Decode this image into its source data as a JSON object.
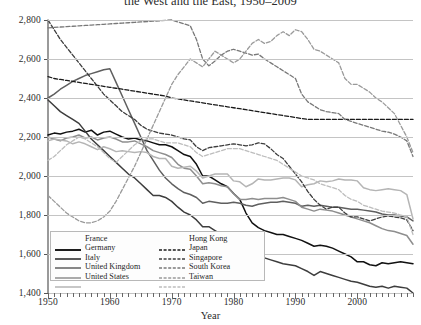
{
  "title": "the West and the East, 1950–2009",
  "axes": {
    "ylabel": "Hours",
    "xlabel": "Year",
    "yticks": [
      "1,400",
      "1,600",
      "1,800",
      "2,000",
      "2,200",
      "2,400",
      "2,600",
      "2,800"
    ],
    "xticks": [
      "1950",
      "1960",
      "1970",
      "1980",
      "1990",
      "2000"
    ]
  },
  "legend": {
    "left": [
      {
        "label": "France",
        "color": "#111111",
        "dash": "none",
        "width": 1.9
      },
      {
        "label": "Germany",
        "color": "#3d3d3d",
        "dash": "none",
        "width": 1.7
      },
      {
        "label": "Italy",
        "color": "#5f5f5f",
        "dash": "none",
        "width": 1.5
      },
      {
        "label": "United Kingdom",
        "color": "#8e8e8e",
        "dash": "none",
        "width": 1.5
      },
      {
        "label": "United States",
        "color": "#b5b5b5",
        "dash": "none",
        "width": 1.5
      }
    ],
    "right": [
      {
        "label": "Hong Kong",
        "color": "#1a1a1a",
        "dash": "4,2",
        "width": 1.5
      },
      {
        "label": "Japan",
        "color": "#3d3d3d",
        "dash": "4,2",
        "width": 1.5
      },
      {
        "label": "Singapore",
        "color": "#787878",
        "dash": "4,2",
        "width": 1.4
      },
      {
        "label": "South Korea",
        "color": "#9a9a9a",
        "dash": "4,2",
        "width": 1.4
      },
      {
        "label": "Taiwan",
        "color": "#bdbdbd",
        "dash": "4,2",
        "width": 1.4
      }
    ]
  },
  "chart_data": {
    "type": "line",
    "title": "the West and the East, 1950–2009",
    "xlabel": "Year",
    "ylabel": "Hours",
    "xlim": [
      1950,
      2009
    ],
    "ylim": [
      1400,
      2800
    ],
    "grid": true,
    "legend_position": "inside-bottom-left",
    "x": [
      1950,
      1951,
      1952,
      1953,
      1954,
      1955,
      1956,
      1957,
      1958,
      1959,
      1960,
      1961,
      1962,
      1963,
      1964,
      1965,
      1966,
      1967,
      1968,
      1969,
      1970,
      1971,
      1972,
      1973,
      1974,
      1975,
      1976,
      1977,
      1978,
      1979,
      1980,
      1981,
      1982,
      1983,
      1984,
      1985,
      1986,
      1987,
      1988,
      1989,
      1990,
      1991,
      1992,
      1993,
      1994,
      1995,
      1996,
      1997,
      1998,
      1999,
      2000,
      2001,
      2002,
      2003,
      2004,
      2005,
      2006,
      2007,
      2008,
      2009
    ],
    "series": [
      {
        "name": "France",
        "color": "#111111",
        "dash": "none",
        "values": [
          2210,
          2220,
          2215,
          2225,
          2230,
          2240,
          2225,
          2235,
          2210,
          2225,
          2230,
          2215,
          2200,
          2190,
          2195,
          2185,
          2180,
          2170,
          2160,
          2160,
          2150,
          2130,
          2110,
          2100,
          2060,
          2000,
          2000,
          1980,
          1960,
          1945,
          1910,
          1880,
          1810,
          1760,
          1735,
          1720,
          1710,
          1700,
          1700,
          1690,
          1680,
          1670,
          1655,
          1640,
          1645,
          1640,
          1630,
          1615,
          1600,
          1585,
          1560,
          1560,
          1545,
          1540,
          1555,
          1550,
          1555,
          1560,
          1555,
          1550
        ]
      },
      {
        "name": "Germany",
        "color": "#3d3d3d",
        "dash": "none",
        "values": [
          2390,
          2360,
          2330,
          2310,
          2290,
          2270,
          2230,
          2190,
          2160,
          2130,
          2100,
          2070,
          2040,
          2010,
          1990,
          1960,
          1930,
          1900,
          1900,
          1890,
          1870,
          1840,
          1815,
          1800,
          1775,
          1740,
          1740,
          1720,
          1700,
          1690,
          1670,
          1650,
          1620,
          1600,
          1590,
          1580,
          1570,
          1560,
          1550,
          1545,
          1540,
          1525,
          1510,
          1490,
          1510,
          1500,
          1490,
          1480,
          1470,
          1460,
          1455,
          1445,
          1435,
          1430,
          1435,
          1425,
          1435,
          1430,
          1425,
          1400
        ]
      },
      {
        "name": "Italy",
        "color": "#5f5f5f",
        "dash": "none",
        "values": [
          2400,
          2420,
          2445,
          2465,
          2485,
          2500,
          2515,
          2525,
          2535,
          2545,
          2550,
          2480,
          2410,
          2340,
          2270,
          2200,
          2130,
          2080,
          2030,
          1990,
          1960,
          1935,
          1915,
          1905,
          1890,
          1860,
          1870,
          1865,
          1860,
          1860,
          1865,
          1860,
          1850,
          1845,
          1855,
          1860,
          1865,
          1865,
          1870,
          1865,
          1860,
          1845,
          1850,
          1845,
          1850,
          1845,
          1840,
          1840,
          1835,
          1830,
          1830,
          1825,
          1820,
          1815,
          1805,
          1800,
          1800,
          1795,
          1790,
          1770
        ]
      },
      {
        "name": "United Kingdom",
        "color": "#8e8e8e",
        "dash": "none",
        "values": [
          2200,
          2190,
          2180,
          2195,
          2200,
          2210,
          2195,
          2200,
          2185,
          2195,
          2200,
          2190,
          2175,
          2175,
          2180,
          2165,
          2150,
          2130,
          2120,
          2110,
          2095,
          2060,
          2040,
          2035,
          2000,
          1960,
          1965,
          1960,
          1950,
          1945,
          1910,
          1880,
          1880,
          1885,
          1880,
          1885,
          1885,
          1885,
          1890,
          1880,
          1870,
          1840,
          1830,
          1820,
          1830,
          1825,
          1820,
          1810,
          1800,
          1790,
          1780,
          1770,
          1760,
          1745,
          1730,
          1720,
          1715,
          1705,
          1695,
          1650
        ]
      },
      {
        "name": "United States",
        "color": "#b5b5b5",
        "dash": "none",
        "values": [
          2180,
          2190,
          2185,
          2180,
          2165,
          2175,
          2165,
          2150,
          2135,
          2150,
          2140,
          2125,
          2130,
          2125,
          2120,
          2125,
          2120,
          2100,
          2090,
          2090,
          2050,
          2040,
          2045,
          2050,
          2025,
          1990,
          2000,
          2010,
          2010,
          2010,
          1975,
          1970,
          1945,
          1960,
          1985,
          1980,
          1980,
          1985,
          1990,
          1990,
          1980,
          1945,
          1955,
          1960,
          1975,
          1970,
          1975,
          1985,
          1980,
          1980,
          1975,
          1940,
          1930,
          1925,
          1930,
          1935,
          1930,
          1925,
          1905,
          1780
        ]
      },
      {
        "name": "Hong Kong",
        "color": "#1a1a1a",
        "dash": "4,2",
        "values": [
          2510,
          2500,
          2495,
          2490,
          2485,
          2480,
          2475,
          2470,
          2465,
          2460,
          2455,
          2450,
          2445,
          2440,
          2435,
          2430,
          2425,
          2420,
          2415,
          2410,
          2400,
          2395,
          2390,
          2385,
          2380,
          2375,
          2370,
          2365,
          2360,
          2355,
          2350,
          2345,
          2340,
          2335,
          2330,
          2325,
          2320,
          2315,
          2310,
          2305,
          2300,
          2295,
          2290,
          2290,
          2290,
          2290,
          2290,
          2290,
          2290,
          2290,
          2290,
          2290,
          2290,
          2290,
          2290,
          2290,
          2290,
          2290,
          2290,
          2290
        ]
      },
      {
        "name": "Japan",
        "color": "#3d3d3d",
        "dash": "4,2",
        "values": [
          2800,
          2750,
          2700,
          2660,
          2620,
          2580,
          2540,
          2500,
          2460,
          2420,
          2390,
          2360,
          2330,
          2310,
          2290,
          2260,
          2240,
          2230,
          2220,
          2215,
          2210,
          2200,
          2190,
          2185,
          2150,
          2130,
          2145,
          2150,
          2155,
          2160,
          2165,
          2160,
          2155,
          2160,
          2170,
          2165,
          2140,
          2110,
          2090,
          2050,
          2010,
          1970,
          1920,
          1880,
          1850,
          1830,
          1840,
          1840,
          1810,
          1790,
          1790,
          1780,
          1770,
          1780,
          1790,
          1795,
          1790,
          1785,
          1775,
          1720
        ]
      },
      {
        "name": "Singapore",
        "color": "#787878",
        "dash": "4,2",
        "values": [
          2760,
          2762,
          2764,
          2766,
          2768,
          2770,
          2772,
          2774,
          2776,
          2778,
          2780,
          2782,
          2784,
          2786,
          2788,
          2790,
          2792,
          2794,
          2796,
          2798,
          2800,
          2790,
          2780,
          2770,
          2700,
          2600,
          2565,
          2590,
          2620,
          2640,
          2650,
          2640,
          2630,
          2620,
          2625,
          2600,
          2580,
          2560,
          2540,
          2520,
          2500,
          2420,
          2380,
          2360,
          2340,
          2330,
          2325,
          2320,
          2290,
          2280,
          2270,
          2260,
          2250,
          2240,
          2230,
          2225,
          2215,
          2200,
          2180,
          2100
        ]
      },
      {
        "name": "South Korea",
        "color": "#9a9a9a",
        "dash": "4,2",
        "values": [
          1900,
          1870,
          1840,
          1810,
          1790,
          1770,
          1760,
          1760,
          1770,
          1790,
          1820,
          1870,
          1930,
          1990,
          2050,
          2120,
          2190,
          2260,
          2330,
          2400,
          2470,
          2520,
          2560,
          2600,
          2580,
          2560,
          2600,
          2640,
          2620,
          2600,
          2580,
          2600,
          2640,
          2680,
          2700,
          2680,
          2690,
          2720,
          2740,
          2720,
          2750,
          2740,
          2700,
          2650,
          2640,
          2620,
          2600,
          2580,
          2500,
          2470,
          2470,
          2450,
          2430,
          2400,
          2380,
          2350,
          2320,
          2260,
          2200,
          2120
        ]
      },
      {
        "name": "Taiwan",
        "color": "#bdbdbd",
        "dash": "4,2",
        "values": [
          2080,
          2100,
          2130,
          2160,
          2180,
          2200,
          2190,
          2170,
          2150,
          2120,
          2090,
          2070,
          2100,
          2130,
          2160,
          2180,
          2190,
          2190,
          2180,
          2170,
          2170,
          2170,
          2160,
          2150,
          2120,
          2100,
          2110,
          2120,
          2130,
          2140,
          2140,
          2140,
          2130,
          2120,
          2110,
          2100,
          2090,
          2080,
          2060,
          2040,
          2020,
          2000,
          1990,
          1980,
          1960,
          1950,
          1940,
          1930,
          1900,
          1880,
          1870,
          1850,
          1840,
          1830,
          1820,
          1815,
          1810,
          1800,
          1790,
          1700
        ]
      }
    ]
  }
}
